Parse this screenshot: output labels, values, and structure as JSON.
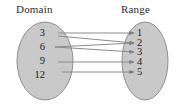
{
  "figure": {
    "type": "mapping-diagram",
    "headings": {
      "domain": "Domain",
      "range": "Range"
    },
    "domain_set": {
      "label": "Domain",
      "ellipse": {
        "cx": 45,
        "cy": 61,
        "rx": 28,
        "ry": 39
      },
      "fill": "#c9c9c9",
      "stroke": "#8e8e8e",
      "nodes": [
        {
          "value": "3",
          "x": 45,
          "y": 33
        },
        {
          "value": "6",
          "x": 45,
          "y": 47
        },
        {
          "value": "9",
          "x": 45,
          "y": 61
        },
        {
          "value": "12",
          "x": 45,
          "y": 75
        }
      ]
    },
    "range_set": {
      "label": "Range",
      "ellipse": {
        "cx": 145,
        "cy": 61,
        "rx": 23,
        "ry": 39
      },
      "fill": "#c9c9c9",
      "stroke": "#8e8e8e",
      "nodes": [
        {
          "value": "1",
          "x": 145,
          "y": 33
        },
        {
          "value": "2",
          "x": 145,
          "y": 43
        },
        {
          "value": "3",
          "x": 145,
          "y": 52
        },
        {
          "value": "4",
          "x": 145,
          "y": 62
        },
        {
          "value": "5",
          "x": 145,
          "y": 72
        }
      ]
    },
    "arrows": [
      {
        "from": "3",
        "to": "1",
        "x1": 58,
        "y1": 33,
        "x2": 134,
        "y2": 33
      },
      {
        "from": "6",
        "to": "2",
        "x1": 55,
        "y1": 47,
        "x2": 134,
        "y2": 43
      },
      {
        "from": "6",
        "to": "3",
        "x1": 55,
        "y1": 47,
        "x2": 134,
        "y2": 52
      },
      {
        "from": "3",
        "to": "2",
        "x1": 58,
        "y1": 36,
        "x2": 134,
        "y2": 43
      },
      {
        "from": "9",
        "to": "4",
        "x1": 58,
        "y1": 62,
        "x2": 134,
        "y2": 62
      },
      {
        "from": "12",
        "to": "5",
        "x1": 62,
        "y1": 72,
        "x2": 134,
        "y2": 72
      }
    ],
    "line_color": "#8a8a8a",
    "mapping_pairs": "3→1, 3→2, 6→2, 6→3, 9→4, 12→5"
  }
}
